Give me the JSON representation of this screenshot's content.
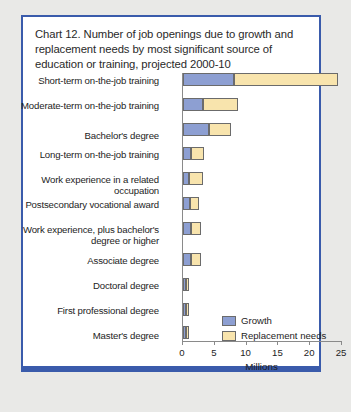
{
  "card": {
    "border_color": "#3a5bab",
    "background": "#ffffff"
  },
  "title": "Chart 12. Number of job openings due to growth and replacement needs by most significant source of education or training, projected 2000-10",
  "legend": {
    "growth_label": "Growth",
    "replacement_label": "Replacement needs"
  },
  "chart_data": {
    "type": "bar",
    "orientation": "horizontal",
    "stacked": true,
    "title": "Chart 12. Number of job openings due to growth and replacement needs by most significant source of education or training, projected 2000-10",
    "xlabel": "Millions",
    "ylabel": "",
    "xlim": [
      0,
      25
    ],
    "xticks": [
      0,
      5,
      10,
      15,
      20,
      25
    ],
    "xtick_labels": [
      "0",
      "5",
      "10",
      "15",
      "20",
      "25"
    ],
    "grid": false,
    "legend_position": "inside-right-lower",
    "categories": [
      "Short-term on-the-job training",
      "Moderate-term on-the-job training",
      "Bachelor's degree",
      "Long-term on-the-job training",
      "Work experience in a related occupation",
      "Postsecondary vocational award",
      "Work experience, plus bachelor's degree or higher",
      "Associate degree",
      "Doctoral degree",
      "First professional degree",
      "Master's degree"
    ],
    "series": [
      {
        "name": "Growth",
        "color": "#8d9fd2",
        "values": [
          8.0,
          3.2,
          4.1,
          1.2,
          1.0,
          1.1,
          1.2,
          1.2,
          0.2,
          0.2,
          0.5
        ]
      },
      {
        "name": "Replacement needs",
        "color": "#f8e4ad",
        "values": [
          16.3,
          5.5,
          3.5,
          2.1,
          2.2,
          1.4,
          1.6,
          1.6,
          0.3,
          0.4,
          0.1
        ]
      }
    ],
    "totals": [
      24.3,
      8.7,
      7.6,
      3.3,
      3.2,
      2.5,
      2.8,
      2.8,
      0.5,
      0.6,
      0.6
    ]
  }
}
